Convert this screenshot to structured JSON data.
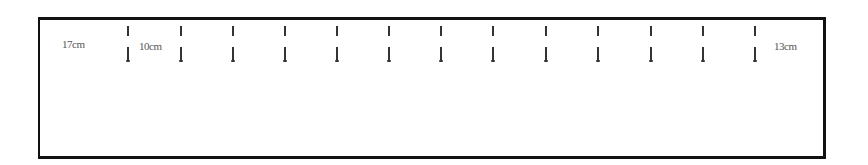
{
  "diagram": {
    "type": "spacing-layout",
    "labels": {
      "left_margin": "17cm",
      "first_gap": "10cm",
      "right_margin": "13cm"
    },
    "tick_count": 13,
    "tick_positions_px": [
      127,
      180,
      232,
      284,
      336,
      388,
      440,
      492,
      545,
      597,
      650,
      702,
      754
    ],
    "colors": {
      "border": "#111111",
      "tick": "#333333",
      "label": "#555555",
      "background": "#ffffff"
    }
  }
}
